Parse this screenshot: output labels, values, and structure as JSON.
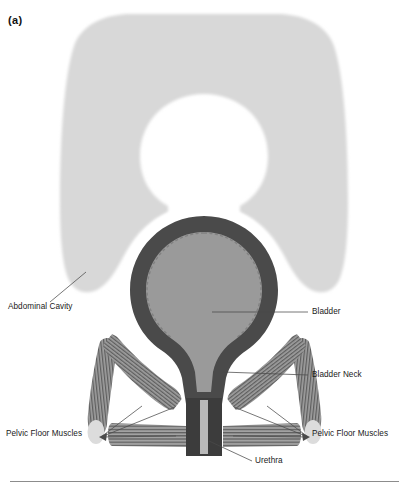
{
  "figure": {
    "panel_letter": "(a)",
    "background_color": "#ffffff"
  },
  "colors": {
    "abdominal_cavity": "#d8d8d8",
    "abdominal_cavity_edge": "#cfcfcf",
    "bladder_wall": "#4a4a4a",
    "bladder_lumen": "#9a9a9a",
    "urethra_wall": "#3c3c3c",
    "urethra_lumen": "#b5b5b5",
    "muscle_base": "#9a9a9a",
    "muscle_stripe": "#5c5c5c",
    "muscle_pale_cap": "#dcdcdc",
    "halo": "#ffffff",
    "leader_line": "#4a4a4a",
    "label_text": "#1a1a1a",
    "rule_line": "#8c8c8c"
  },
  "labels": [
    {
      "id": "abdominal-cavity",
      "text": "Abdominal Cavity",
      "anchor_side": "left",
      "leaders": 1
    },
    {
      "id": "bladder",
      "text": "Bladder",
      "anchor_side": "right",
      "leaders": 1
    },
    {
      "id": "bladder-neck",
      "text": "Bladder Neck",
      "anchor_side": "right",
      "leaders": 1
    },
    {
      "id": "pelvic-floor-muscles-left",
      "text": "Pelvic Floor Muscles",
      "anchor_side": "left",
      "leaders": 3
    },
    {
      "id": "pelvic-floor-muscles-right",
      "text": "Pelvic Floor Muscles",
      "anchor_side": "right",
      "leaders": 3
    },
    {
      "id": "urethra",
      "text": "Urethra",
      "anchor_side": "right",
      "leaders": 1
    }
  ],
  "structures": [
    {
      "id": "abdominal-cavity",
      "name": "Abdominal Cavity",
      "kind": "region"
    },
    {
      "id": "bladder",
      "name": "Bladder",
      "kind": "organ"
    },
    {
      "id": "bladder-neck",
      "name": "Bladder Neck",
      "kind": "organ-part"
    },
    {
      "id": "urethra",
      "name": "Urethra",
      "kind": "organ"
    },
    {
      "id": "pelvic-floor-muscle-outer-left",
      "name": "Pelvic floor muscle band (outer left)",
      "kind": "muscle"
    },
    {
      "id": "pelvic-floor-muscle-inner-left",
      "name": "Pelvic floor muscle band (inner left)",
      "kind": "muscle"
    },
    {
      "id": "pelvic-floor-muscle-outer-right",
      "name": "Pelvic floor muscle band (outer right)",
      "kind": "muscle"
    },
    {
      "id": "pelvic-floor-muscle-inner-right",
      "name": "Pelvic floor muscle band (inner right)",
      "kind": "muscle"
    },
    {
      "id": "pelvic-floor-sheet",
      "name": "Pelvic floor muscle sheet (horizontal)",
      "kind": "muscle"
    }
  ],
  "footer": {
    "rule_visible": true
  }
}
